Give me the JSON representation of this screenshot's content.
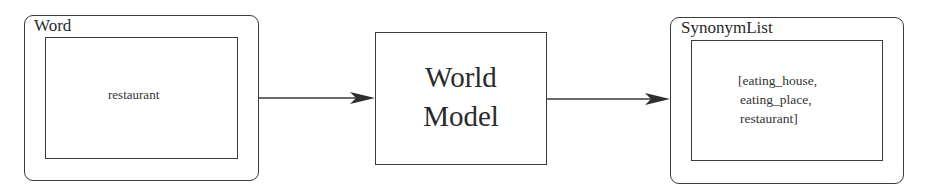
{
  "diagram": {
    "nodes": [
      {
        "id": "word",
        "label": "Word",
        "value": "restaurant",
        "shape": "rounded-rect-with-inner-rect"
      },
      {
        "id": "world_model",
        "label_lines": [
          "World",
          "Model"
        ],
        "shape": "rect"
      },
      {
        "id": "synonym_list",
        "label": "SynonymList",
        "value_lines": [
          "[eating_house,",
          "eating_place,",
          "restaurant]"
        ],
        "shape": "rounded-rect-with-inner-rect"
      }
    ],
    "edges": [
      {
        "from": "word",
        "to": "world_model",
        "style": "arrow"
      },
      {
        "from": "world_model",
        "to": "synonym_list",
        "style": "arrow"
      }
    ],
    "colors": {
      "stroke": "#3a3a3a",
      "text": "#2a2a2a",
      "background": "#ffffff"
    }
  }
}
